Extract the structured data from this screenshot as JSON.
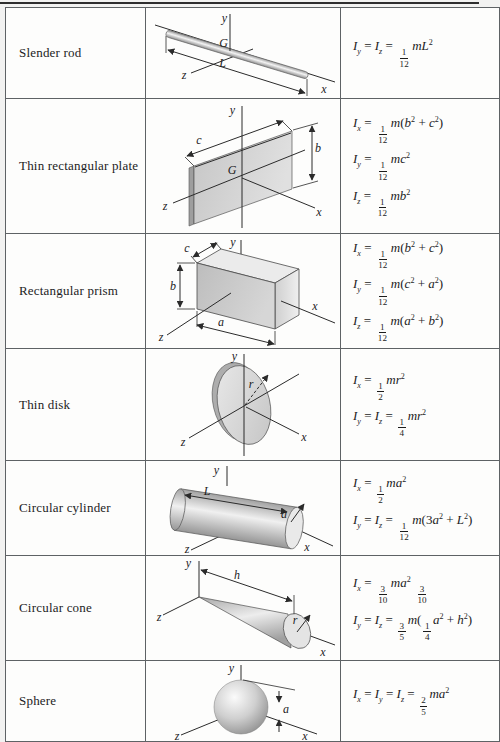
{
  "page": {
    "colors": {
      "page_bg": "#f2f2f1",
      "cell_bg": "#fdfdfc",
      "border": "#5e6265",
      "top_rule": "#2e2e2e"
    }
  },
  "table": {
    "rows": [
      {
        "name": "Slender rod",
        "fig": {
          "y": "y",
          "G": "G",
          "L": "L",
          "z": "z",
          "x": "x"
        },
        "formulas": [
          "I_y = I_z = {1|12}mL^2"
        ]
      },
      {
        "name": "Thin rectangular plate",
        "fig": {
          "y": "y",
          "c": "c",
          "b": "b",
          "G": "G",
          "z": "z",
          "x": "x"
        },
        "formulas": [
          "I_x = {1|12}m(b^2 + c^2)",
          "I_y = {1|12}mc^2",
          "I_z = {1|12}mb^2"
        ]
      },
      {
        "name": "Rectangular prism",
        "fig": {
          "y": "y",
          "c": "c",
          "b": "b",
          "a": "a",
          "z": "z",
          "x": "x"
        },
        "formulas": [
          "I_x = {1|12}m(b^2 + c^2)",
          "I_y = {1|12}m(c^2 + a^2)",
          "I_z = {1|12}m(a^2 + b^2)"
        ]
      },
      {
        "name": "Thin disk",
        "fig": {
          "y": "y",
          "r": "r",
          "z": "z",
          "x": "x"
        },
        "formulas": [
          "I_x = {1|2}mr^2",
          "I_y = I_z = {1|4}mr^2"
        ]
      },
      {
        "name": "Circular cylinder",
        "fig": {
          "y": "y",
          "L": "L",
          "a": "a",
          "z": "z",
          "x": "x"
        },
        "formulas": [
          "I_x = {1|2}ma^2",
          "I_y = I_z = {1|12}m(3a^2 + L^2)"
        ]
      },
      {
        "name": "Circular cone",
        "fig": {
          "y": "y",
          "h": "h",
          "r": "r",
          "z": "z",
          "x": "x"
        },
        "formulas": [
          "I_x = {3|10}ma^2 {3|10}",
          "I_y = I_z = {3|5}m({1|4}a^2 + h^2)"
        ]
      },
      {
        "name": "Sphere",
        "fig": {
          "y": "y",
          "a": "a",
          "z": "z",
          "x": "x"
        },
        "formulas": [
          "I_x = I_y = I_z = {2|5}ma^2"
        ]
      }
    ]
  }
}
